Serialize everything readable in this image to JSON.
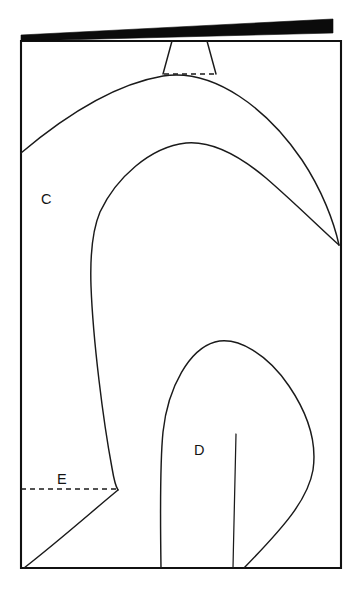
{
  "figure": {
    "type": "line-drawing",
    "title": "",
    "background_color": "#ffffff",
    "stroke_color": "#1a1a1a",
    "wedge_color": "#0b0b0b",
    "canvas": {
      "width": 362,
      "height": 598
    },
    "labels": {
      "c": "C",
      "d": "D",
      "e": "E"
    },
    "frame": {
      "left": 21,
      "top": 41,
      "right": 341,
      "bottom": 568
    },
    "elements": {
      "top_wedge_name": "black-tapered-band",
      "neck_name": "neck-outline",
      "neck_dashed_name": "neck-base-dashed-line",
      "outer_arc_name": "outer-arc-contour",
      "inner_arc_name": "inner-arc-contour",
      "teardrop_name": "teardrop-contour",
      "teardrop_inner_name": "teardrop-inner-line",
      "baseline_dashed_name": "level-e-dashed-line"
    },
    "geometry": {
      "wedge_points": "21,35 333,19 333,33 21,41",
      "neck_left_path": "M 172 41 L 163 74",
      "neck_right_path": "M 207 41 L 216 74",
      "neck_dash_path": "M 164 74 L 215 74",
      "outer_arc_path": "M 21 153 C 60 120 110 85 163 76 C 215 68 268 110 302 160 C 322 190 334 222 339 245",
      "inner_arc_path": "M 339 245 C 320 228 296 204 266 178 C 235 152 208 141 186 143 C 150 147 116 178 100 212 C 92 231 90 256 91 286 C 93 340 103 420 112 468 C 114 480 116 487 118 490",
      "inner_lower_path": "M 118 490 C 96 508 60 540 24 568",
      "dashed_e_path": "M 21 489 L 117 489",
      "teardrop_path": "M 161 568 C 160 500 161 452 163 432 C 168 386 190 349 215 342 C 238 336 268 355 289 386 C 308 414 317 443 313 470 C 308 499 285 526 244 568",
      "teardrop_inner_path": "M 236 434 C 235 470 234 520 233 568"
    }
  }
}
